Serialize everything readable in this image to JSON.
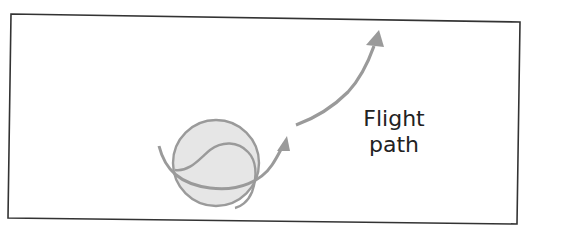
{
  "diagram": {
    "title_label": {
      "line1": "Flight",
      "line2": "path"
    },
    "colors": {
      "frame": "#333333",
      "ball_fill": "#e6e6e6",
      "ball_stroke": "#9a9a9a",
      "arrow": "#9a9a9a",
      "text": "#222222"
    },
    "elements": [
      "ball",
      "ball-seam",
      "spin-arrow",
      "flight-path-arrow",
      "flight-path-label"
    ]
  }
}
